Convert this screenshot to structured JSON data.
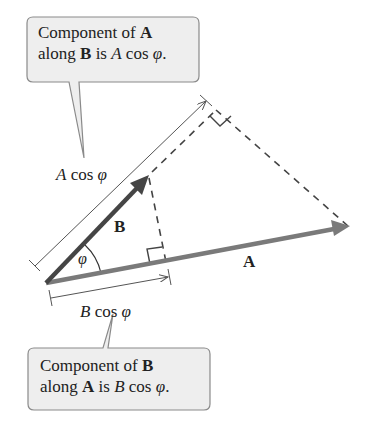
{
  "diagram": {
    "colors": {
      "vector_A": "#7a7a7a",
      "vector_B": "#454545",
      "dashed": "#444444",
      "dimension": "#555555",
      "callout_fill": "#eeeeee",
      "callout_stroke": "#8a8a8a"
    },
    "vectors": {
      "A": {
        "label": "A"
      },
      "B": {
        "label": "B"
      }
    },
    "angle_label": "φ",
    "dimension_A": {
      "var": "A",
      "text": " cos ",
      "phi": "φ"
    },
    "dimension_B": {
      "var": "B",
      "text": " cos ",
      "phi": "φ"
    },
    "callout_top": {
      "line1_text": "Component of ",
      "line1_bold": "A",
      "line2_pre": "along ",
      "line2_bold": "B",
      "line2_mid": " is ",
      "line2_italic": "A",
      "line2_post": " cos ",
      "line2_phi": "φ",
      "line2_end": "."
    },
    "callout_bottom": {
      "line1_text": "Component of ",
      "line1_bold": "B",
      "line2_pre": "along ",
      "line2_bold": "A",
      "line2_mid": " is ",
      "line2_italic": "B",
      "line2_post": " cos ",
      "line2_phi": "φ",
      "line2_end": "."
    }
  }
}
